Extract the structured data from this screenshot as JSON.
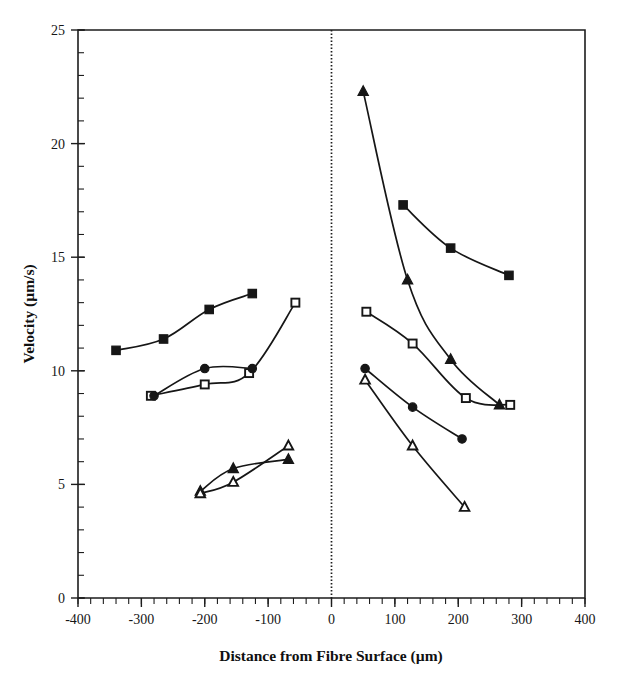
{
  "figure": {
    "background_color": "#ffffff",
    "ink_color": "#161616"
  },
  "chart_data": {
    "type": "line",
    "title": "",
    "subtitle": "",
    "xlabel": "Distance from Fibre Surface (µm)",
    "ylabel": "Velocity  (µm/s)",
    "xlim": [
      -400,
      400
    ],
    "ylim": [
      0,
      25
    ],
    "xticks": [
      -400,
      -300,
      -200,
      -100,
      0,
      100,
      200,
      300,
      400
    ],
    "xtick_labels": [
      "-400",
      "-300",
      "-200",
      "-100",
      "0",
      "100",
      "200",
      "300",
      "400"
    ],
    "yticks": [
      0,
      5,
      10,
      15,
      20,
      25
    ],
    "ytick_labels": [
      "0",
      "5",
      "10",
      "15",
      "20",
      "25"
    ],
    "x_minor_tick_step": 20,
    "y_minor_tick_step": 1,
    "grid": false,
    "legend": false,
    "legend_position": "none",
    "annotations": [
      {
        "name": "fibre-surface-marker",
        "type": "vertical-dotted-line",
        "x": 0,
        "label": ""
      }
    ],
    "series": [
      {
        "name": "upper-left-filled-square",
        "marker": "filled-square",
        "side": "left",
        "points": [
          {
            "x": -340,
            "y": 10.9
          },
          {
            "x": -265,
            "y": 11.4
          },
          {
            "x": -193,
            "y": 12.7
          },
          {
            "x": -125,
            "y": 13.4
          }
        ]
      },
      {
        "name": "mid-left-open-square",
        "marker": "open-square",
        "side": "left",
        "points": [
          {
            "x": -285,
            "y": 8.9
          },
          {
            "x": -200,
            "y": 9.4
          },
          {
            "x": -130,
            "y": 9.9
          },
          {
            "x": -57,
            "y": 13.0
          }
        ]
      },
      {
        "name": "mid-left-filled-circle",
        "marker": "filled-circle",
        "side": "left",
        "points": [
          {
            "x": -280,
            "y": 8.9
          },
          {
            "x": -200,
            "y": 10.1
          },
          {
            "x": -125,
            "y": 10.1
          }
        ]
      },
      {
        "name": "lower-left-filled-triangle",
        "marker": "filled-triangle",
        "side": "left",
        "points": [
          {
            "x": -207,
            "y": 4.7
          },
          {
            "x": -155,
            "y": 5.7
          },
          {
            "x": -68,
            "y": 6.1
          }
        ]
      },
      {
        "name": "lower-left-open-triangle",
        "marker": "open-triangle",
        "side": "left",
        "points": [
          {
            "x": -207,
            "y": 4.6
          },
          {
            "x": -155,
            "y": 5.1
          },
          {
            "x": -68,
            "y": 6.7
          }
        ]
      },
      {
        "name": "right-filled-triangle-upper",
        "marker": "filled-triangle",
        "side": "right",
        "points": [
          {
            "x": 50,
            "y": 22.3
          },
          {
            "x": 120,
            "y": 14.0
          },
          {
            "x": 188,
            "y": 10.5
          },
          {
            "x": 265,
            "y": 8.5
          }
        ]
      },
      {
        "name": "right-filled-square",
        "marker": "filled-square",
        "side": "right",
        "points": [
          {
            "x": 113,
            "y": 17.3
          },
          {
            "x": 188,
            "y": 15.4
          },
          {
            "x": 280,
            "y": 14.2
          }
        ]
      },
      {
        "name": "right-open-square",
        "marker": "open-square",
        "side": "right",
        "points": [
          {
            "x": 55,
            "y": 12.6
          },
          {
            "x": 128,
            "y": 11.2
          },
          {
            "x": 212,
            "y": 8.8
          },
          {
            "x": 282,
            "y": 8.5
          }
        ]
      },
      {
        "name": "right-filled-circle",
        "marker": "filled-circle",
        "side": "right",
        "points": [
          {
            "x": 53,
            "y": 10.1
          },
          {
            "x": 128,
            "y": 8.4
          },
          {
            "x": 206,
            "y": 7.0
          }
        ]
      },
      {
        "name": "right-open-triangle-lower",
        "marker": "open-triangle",
        "side": "right",
        "points": [
          {
            "x": 53,
            "y": 9.6
          },
          {
            "x": 128,
            "y": 6.7
          },
          {
            "x": 210,
            "y": 4.0
          }
        ]
      }
    ]
  }
}
